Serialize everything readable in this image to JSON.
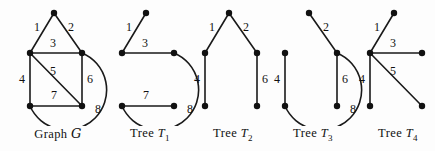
{
  "figure": {
    "background_color": "#fdfdfd",
    "ink_color": "#111111",
    "panels": [
      {
        "id": "graph-g",
        "caption_prefix": "Graph",
        "caption_symbol": "G",
        "caption_subscript": "",
        "kind": "graph",
        "nodes": [
          {
            "id": "a",
            "x": 46,
            "y": 13
          },
          {
            "id": "b",
            "x": 22,
            "y": 53
          },
          {
            "id": "c",
            "x": 74,
            "y": 53
          },
          {
            "id": "d",
            "x": 22,
            "y": 106
          },
          {
            "id": "e",
            "x": 74,
            "y": 106
          }
        ],
        "edges": [
          {
            "label": "1",
            "from": "a",
            "to": "b",
            "type": "line",
            "lx": 29,
            "ly": 31
          },
          {
            "label": "2",
            "from": "a",
            "to": "c",
            "type": "line",
            "lx": 63,
            "ly": 31
          },
          {
            "label": "3",
            "from": "b",
            "to": "c",
            "type": "line",
            "lx": 45,
            "ly": 47
          },
          {
            "label": "4",
            "from": "b",
            "to": "d",
            "type": "line",
            "lx": 14,
            "ly": 83
          },
          {
            "label": "5",
            "from": "b",
            "to": "e",
            "type": "line",
            "lx": 45,
            "ly": 75
          },
          {
            "label": "6",
            "from": "c",
            "to": "e",
            "type": "line",
            "lx": 82,
            "ly": 83
          },
          {
            "label": "7",
            "from": "d",
            "to": "e",
            "type": "line",
            "lx": 46,
            "ly": 99
          },
          {
            "label": "8",
            "from": "c",
            "to": "d",
            "type": "arc",
            "sweep": 1,
            "rx": 40,
            "ry": 40,
            "lx": 90,
            "ly": 113
          }
        ]
      },
      {
        "id": "tree-t1",
        "caption_prefix": "Tree",
        "caption_symbol": "T",
        "caption_subscript": "1",
        "kind": "tree",
        "nodes": [
          {
            "id": "a",
            "x": 46,
            "y": 13
          },
          {
            "id": "b",
            "x": 22,
            "y": 53
          },
          {
            "id": "c",
            "x": 74,
            "y": 53
          },
          {
            "id": "d",
            "x": 22,
            "y": 106
          },
          {
            "id": "e",
            "x": 74,
            "y": 106
          }
        ],
        "edges": [
          {
            "label": "1",
            "from": "a",
            "to": "b",
            "type": "line",
            "lx": 29,
            "ly": 31
          },
          {
            "label": "3",
            "from": "b",
            "to": "c",
            "type": "line",
            "lx": 45,
            "ly": 47
          },
          {
            "label": "7",
            "from": "d",
            "to": "e",
            "type": "line",
            "lx": 46,
            "ly": 99
          },
          {
            "label": "8",
            "from": "c",
            "to": "d",
            "type": "arc",
            "sweep": 1,
            "rx": 40,
            "ry": 40,
            "lx": 90,
            "ly": 113
          }
        ]
      },
      {
        "id": "tree-t2",
        "caption_prefix": "Tree",
        "caption_symbol": "T",
        "caption_subscript": "2",
        "kind": "tree",
        "nodes": [
          {
            "id": "a",
            "x": 46,
            "y": 13
          },
          {
            "id": "b",
            "x": 22,
            "y": 53
          },
          {
            "id": "c",
            "x": 74,
            "y": 53
          },
          {
            "id": "d",
            "x": 22,
            "y": 106
          },
          {
            "id": "e",
            "x": 74,
            "y": 106
          }
        ],
        "edges": [
          {
            "label": "1",
            "from": "a",
            "to": "b",
            "type": "line",
            "lx": 29,
            "ly": 31
          },
          {
            "label": "2",
            "from": "a",
            "to": "c",
            "type": "line",
            "lx": 63,
            "ly": 31
          },
          {
            "label": "4",
            "from": "b",
            "to": "d",
            "type": "line",
            "lx": 14,
            "ly": 83
          },
          {
            "label": "6",
            "from": "c",
            "to": "e",
            "type": "line",
            "lx": 82,
            "ly": 83
          }
        ]
      },
      {
        "id": "tree-t3",
        "caption_prefix": "Tree",
        "caption_symbol": "T",
        "caption_subscript": "3",
        "kind": "tree",
        "nodes": [
          {
            "id": "a",
            "x": 46,
            "y": 13
          },
          {
            "id": "b",
            "x": 22,
            "y": 53
          },
          {
            "id": "c",
            "x": 74,
            "y": 53
          },
          {
            "id": "d",
            "x": 22,
            "y": 106
          },
          {
            "id": "e",
            "x": 74,
            "y": 106
          }
        ],
        "edges": [
          {
            "label": "2",
            "from": "a",
            "to": "c",
            "type": "line",
            "lx": 63,
            "ly": 31
          },
          {
            "label": "4",
            "from": "b",
            "to": "d",
            "type": "line",
            "lx": 14,
            "ly": 83
          },
          {
            "label": "6",
            "from": "c",
            "to": "e",
            "type": "line",
            "lx": 82,
            "ly": 83
          },
          {
            "label": "8",
            "from": "c",
            "to": "d",
            "type": "arc",
            "sweep": 1,
            "rx": 40,
            "ry": 40,
            "lx": 90,
            "ly": 113
          }
        ]
      },
      {
        "id": "tree-t4",
        "caption_prefix": "Tree",
        "caption_symbol": "T",
        "caption_subscript": "4",
        "kind": "tree",
        "nodes": [
          {
            "id": "a",
            "x": 46,
            "y": 13
          },
          {
            "id": "b",
            "x": 22,
            "y": 53
          },
          {
            "id": "c",
            "x": 74,
            "y": 53
          },
          {
            "id": "d",
            "x": 22,
            "y": 106
          },
          {
            "id": "e",
            "x": 74,
            "y": 106
          }
        ],
        "edges": [
          {
            "label": "1",
            "from": "a",
            "to": "b",
            "type": "line",
            "lx": 29,
            "ly": 31
          },
          {
            "label": "3",
            "from": "b",
            "to": "c",
            "type": "line",
            "lx": 45,
            "ly": 47
          },
          {
            "label": "4",
            "from": "b",
            "to": "d",
            "type": "line",
            "lx": 14,
            "ly": 83
          },
          {
            "label": "5",
            "from": "b",
            "to": "e",
            "type": "line",
            "lx": 45,
            "ly": 75
          }
        ]
      }
    ],
    "panel_offsets": [
      8,
      100,
      183,
      263,
      348
    ],
    "node_radius": 3.2
  }
}
